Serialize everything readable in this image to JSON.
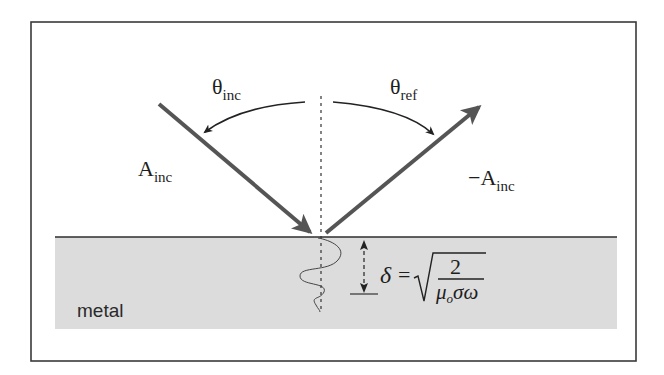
{
  "diagram": {
    "colors": {
      "background": "#ffffff",
      "frame": "#3a3a3a",
      "metal_fill": "#dcdcdc",
      "surface_line": "#2e2e2e",
      "arrow": "#555555",
      "arc": "#222222",
      "text": "#1e1e1e"
    },
    "labels": {
      "theta_inc": {
        "base": "θ",
        "sub": "inc"
      },
      "theta_ref": {
        "base": "θ",
        "sub": "ref"
      },
      "a_inc": {
        "base": "A",
        "sub": "inc"
      },
      "neg_a_inc": {
        "base": "−A",
        "sub": "inc"
      },
      "metal": "metal"
    },
    "formula": {
      "lhs": "δ",
      "equals": "=",
      "numerator": "2",
      "denominator_mu": "μ",
      "denominator_mu_sub": "o",
      "denominator_rest": "σω"
    },
    "elements": [
      {
        "id": "incident-wave-arrow",
        "from": [
          159,
          104
        ],
        "to": [
          315,
          237
        ],
        "label": "A_inc"
      },
      {
        "id": "reflected-wave-arrow",
        "from": [
          326,
          233
        ],
        "to": [
          484,
          103
        ],
        "label": "-A_inc"
      },
      {
        "id": "surface-normal",
        "type": "dashed-line",
        "x": 321,
        "y_range": [
          96,
          310
        ]
      },
      {
        "id": "incidence-angle-arc",
        "label": "θ_inc"
      },
      {
        "id": "reflection-angle-arc",
        "label": "θ_ref"
      },
      {
        "id": "skin-depth-indicator",
        "label": "δ"
      },
      {
        "id": "decaying-wave",
        "region": "metal"
      }
    ]
  }
}
